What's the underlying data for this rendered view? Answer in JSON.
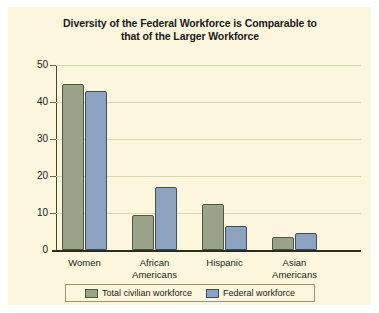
{
  "chart_data": {
    "type": "bar",
    "title": "Diversity of the Federal Workforce is Comparable to that of the Larger Workforce",
    "title_lines": [
      "Diversity of the Federal Workforce is Comparable to",
      "that of the Larger Workforce"
    ],
    "xlabel": "",
    "ylabel": "",
    "ylim": [
      0,
      50
    ],
    "yticks": [
      0,
      10,
      20,
      30,
      40,
      50
    ],
    "grid": true,
    "legend_position": "bottom",
    "categories": [
      "Women",
      "African Americans",
      "Hispanic",
      "Asian Americans"
    ],
    "category_lines": [
      [
        "Women",
        ""
      ],
      [
        "African",
        "Americans"
      ],
      [
        "Hispanic",
        ""
      ],
      [
        "Asian",
        "Americans"
      ]
    ],
    "series": [
      {
        "name": "Total civilian workforce",
        "color": "#9aa389",
        "values": [
          45.0,
          9.5,
          12.5,
          3.5
        ]
      },
      {
        "name": "Federal workforce",
        "color": "#8ba3bf",
        "values": [
          43.0,
          17.0,
          6.5,
          4.5
        ]
      }
    ]
  },
  "figure": {
    "background_color": "#fbf6dc",
    "axis_color": "#2b2b20",
    "gridline_color": "#ddd6b4"
  }
}
